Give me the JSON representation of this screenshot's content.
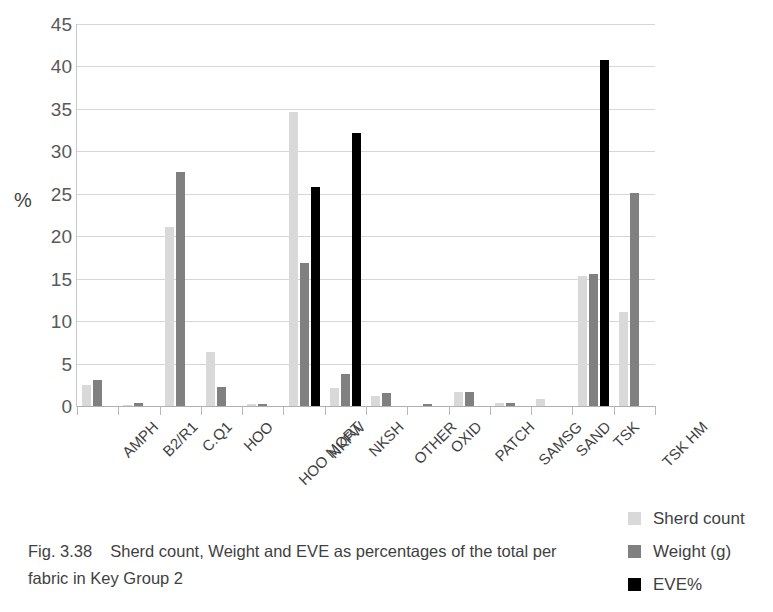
{
  "figure": {
    "caption_number": "Fig. 3.38",
    "caption_text": "Sherd count, Weight and EVE as percentages of the total per fabric in Key Group 2"
  },
  "legend": {
    "position": "right-bottom",
    "items": [
      {
        "label": "Sherd count",
        "color": "#d9d9d9"
      },
      {
        "label": "Weight (g)",
        "color": "#808080"
      },
      {
        "label": "EVE%",
        "color": "#000000"
      }
    ]
  },
  "chart_data": {
    "type": "bar",
    "title": "",
    "subtitle": "",
    "xlabel": "",
    "ylabel": "%",
    "ylim": [
      0,
      45
    ],
    "yticks": [
      0,
      5,
      10,
      15,
      20,
      25,
      30,
      35,
      40,
      45
    ],
    "ytick_labels": [
      "0",
      "5",
      "10",
      "15",
      "20",
      "25",
      "30",
      "35",
      "40",
      "45"
    ],
    "grid": true,
    "grid_axis": "y",
    "legend_position": "right",
    "categories": [
      "AMPH",
      "B2/R1",
      "C.Q1",
      "HOO",
      "HOO MORT",
      "NKFW",
      "NKSH",
      "OTHER",
      "OXID",
      "PATCH",
      "SAMSG",
      "SAND",
      "TSK",
      "TSK HM"
    ],
    "series": [
      {
        "name": "Sherd count",
        "color": "#d9d9d9",
        "values": [
          2.5,
          0.1,
          21.1,
          6.4,
          0.2,
          34.6,
          2.1,
          1.2,
          0.0,
          1.7,
          0.3,
          0.85,
          15.3,
          11.1
        ]
      },
      {
        "name": "Weight (g)",
        "color": "#808080",
        "values": [
          3.1,
          0.35,
          27.6,
          2.2,
          0.25,
          16.8,
          3.8,
          1.5,
          0.2,
          1.6,
          0.3,
          0.0,
          15.6,
          25.1
        ]
      },
      {
        "name": "EVE%",
        "color": "#000000",
        "values": [
          0.0,
          0.0,
          0.0,
          0.0,
          0.0,
          25.8,
          32.2,
          0.0,
          0.0,
          0.0,
          0.0,
          0.0,
          40.8,
          0.0
        ]
      }
    ]
  }
}
